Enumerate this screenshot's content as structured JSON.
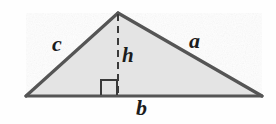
{
  "figure": {
    "name": "triangle-with-height",
    "background_color": "#fefefe",
    "fill_color": "#e4e4e4",
    "stroke_color": "#555555",
    "label_color": "#1c1c1c",
    "vertices": {
      "left": [
        26,
        96
      ],
      "apex": [
        118,
        13
      ],
      "right": [
        262,
        96
      ]
    },
    "altitude": {
      "from": [
        118,
        14
      ],
      "to": [
        118,
        95
      ],
      "style": "dashed"
    },
    "right_angle_marker": {
      "x": 101,
      "y": 80,
      "size": 15
    },
    "labels": {
      "side_c": "c",
      "side_a": "a",
      "height_h": "h",
      "base_b": "b"
    }
  }
}
